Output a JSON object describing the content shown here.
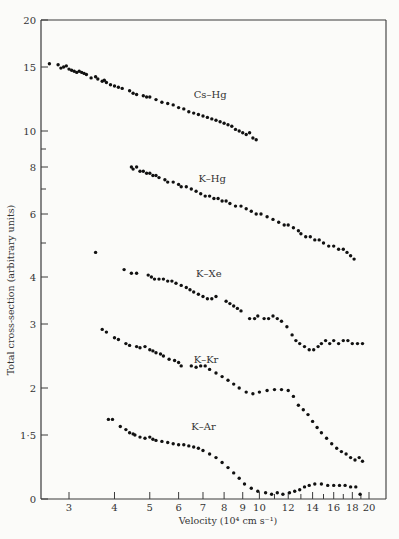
{
  "chart_data": {
    "type": "scatter",
    "title": "",
    "xlabel": "Velocity (10⁴ cm s⁻¹)",
    "ylabel": "Total cross-section (arbitrary units)",
    "xscale": "log",
    "yscale": "log (broken axis, 0 at bottom)",
    "xlim": [
      2.5,
      21
    ],
    "x_ticks": [
      3,
      4,
      5,
      6,
      7,
      8,
      9,
      10,
      12,
      14,
      16,
      18,
      20
    ],
    "y_ticks": [
      "0",
      "1·5",
      "2",
      "3",
      "4",
      "6",
      "8",
      "10",
      "15",
      "20"
    ],
    "y_minor_ticks": [
      5,
      7,
      9
    ],
    "grid": false,
    "legend": "inline labels next to each series",
    "series": [
      {
        "name": "Cs–Hg",
        "label_at": [
          6.6,
          12.3
        ],
        "points": [
          [
            2.65,
            15.3
          ],
          [
            2.8,
            15.2
          ],
          [
            2.85,
            14.9
          ],
          [
            2.9,
            15.0
          ],
          [
            2.95,
            15.1
          ],
          [
            3.0,
            14.8
          ],
          [
            3.05,
            14.7
          ],
          [
            3.1,
            14.6
          ],
          [
            3.15,
            14.5
          ],
          [
            3.2,
            14.6
          ],
          [
            3.25,
            14.5
          ],
          [
            3.3,
            14.4
          ],
          [
            3.35,
            14.3
          ],
          [
            3.45,
            14.0
          ],
          [
            3.55,
            14.1
          ],
          [
            3.6,
            13.9
          ],
          [
            3.7,
            13.7
          ],
          [
            3.75,
            13.8
          ],
          [
            3.8,
            13.6
          ],
          [
            3.9,
            13.4
          ],
          [
            4.0,
            13.3
          ],
          [
            4.1,
            13.2
          ],
          [
            4.2,
            13.1
          ],
          [
            4.4,
            12.9
          ],
          [
            4.5,
            12.7
          ],
          [
            4.6,
            12.6
          ],
          [
            4.8,
            12.5
          ],
          [
            4.9,
            12.4
          ],
          [
            5.0,
            12.4
          ],
          [
            5.2,
            12.2
          ],
          [
            5.4,
            12.0
          ],
          [
            5.6,
            11.9
          ],
          [
            5.8,
            11.8
          ],
          [
            6.0,
            11.6
          ],
          [
            6.2,
            11.5
          ],
          [
            6.4,
            11.3
          ],
          [
            6.6,
            11.2
          ],
          [
            6.8,
            11.1
          ],
          [
            7.0,
            11.0
          ],
          [
            7.2,
            10.9
          ],
          [
            7.4,
            10.8
          ],
          [
            7.6,
            10.7
          ],
          [
            7.8,
            10.6
          ],
          [
            8.0,
            10.5
          ],
          [
            8.2,
            10.4
          ],
          [
            8.4,
            10.3
          ],
          [
            8.6,
            10.1
          ],
          [
            8.8,
            10.0
          ],
          [
            9.0,
            9.9
          ],
          [
            9.2,
            9.8
          ],
          [
            9.4,
            9.9
          ],
          [
            9.6,
            9.6
          ],
          [
            9.8,
            9.5
          ]
        ]
      },
      {
        "name": "K–Hg",
        "label_at": [
          6.8,
          7.3
        ],
        "points": [
          [
            4.45,
            8.0
          ],
          [
            4.5,
            7.9
          ],
          [
            4.6,
            8.0
          ],
          [
            4.7,
            7.8
          ],
          [
            4.8,
            7.8
          ],
          [
            4.9,
            7.7
          ],
          [
            5.0,
            7.7
          ],
          [
            5.1,
            7.6
          ],
          [
            5.2,
            7.6
          ],
          [
            5.3,
            7.5
          ],
          [
            5.5,
            7.4
          ],
          [
            5.6,
            7.3
          ],
          [
            5.8,
            7.3
          ],
          [
            6.0,
            7.2
          ],
          [
            6.1,
            7.1
          ],
          [
            6.3,
            7.1
          ],
          [
            6.5,
            7.0
          ],
          [
            6.7,
            6.9
          ],
          [
            6.9,
            6.8
          ],
          [
            7.1,
            6.7
          ],
          [
            7.3,
            6.7
          ],
          [
            7.5,
            6.6
          ],
          [
            7.7,
            6.6
          ],
          [
            7.9,
            6.5
          ],
          [
            8.1,
            6.5
          ],
          [
            8.3,
            6.4
          ],
          [
            8.6,
            6.3
          ],
          [
            8.9,
            6.3
          ],
          [
            9.2,
            6.2
          ],
          [
            9.5,
            6.1
          ],
          [
            9.8,
            6.0
          ],
          [
            10.1,
            6.0
          ],
          [
            10.5,
            5.9
          ],
          [
            10.9,
            5.8
          ],
          [
            11.3,
            5.7
          ],
          [
            11.7,
            5.6
          ],
          [
            12.0,
            5.6
          ],
          [
            12.4,
            5.5
          ],
          [
            12.8,
            5.4
          ],
          [
            13.0,
            5.3
          ],
          [
            13.4,
            5.2
          ],
          [
            13.8,
            5.2
          ],
          [
            14.2,
            5.1
          ],
          [
            14.6,
            5.1
          ],
          [
            15.0,
            5.0
          ],
          [
            15.5,
            4.9
          ],
          [
            16.0,
            4.9
          ],
          [
            16.5,
            4.8
          ],
          [
            17.0,
            4.8
          ],
          [
            17.4,
            4.7
          ],
          [
            17.8,
            4.6
          ],
          [
            18.2,
            4.5
          ]
        ]
      },
      {
        "name": "K–Xe",
        "label_at": [
          6.7,
          4.0
        ],
        "points": [
          [
            3.55,
            4.7
          ],
          [
            4.25,
            4.2
          ],
          [
            4.45,
            4.1
          ],
          [
            4.6,
            4.1
          ],
          [
            4.95,
            4.05
          ],
          [
            5.05,
            4.0
          ],
          [
            5.15,
            3.95
          ],
          [
            5.3,
            3.95
          ],
          [
            5.45,
            3.95
          ],
          [
            5.6,
            3.9
          ],
          [
            5.75,
            3.9
          ],
          [
            5.9,
            3.85
          ],
          [
            6.1,
            3.8
          ],
          [
            6.3,
            3.75
          ],
          [
            6.45,
            3.7
          ],
          [
            6.6,
            3.65
          ],
          [
            6.8,
            3.6
          ],
          [
            7.0,
            3.55
          ],
          [
            7.2,
            3.5
          ],
          [
            7.4,
            3.5
          ],
          [
            7.6,
            3.55
          ],
          [
            8.1,
            3.45
          ],
          [
            8.3,
            3.4
          ],
          [
            8.5,
            3.35
          ],
          [
            8.7,
            3.3
          ],
          [
            8.9,
            3.25
          ],
          [
            9.4,
            3.1
          ],
          [
            9.7,
            3.1
          ],
          [
            9.9,
            3.15
          ],
          [
            10.3,
            3.1
          ],
          [
            10.6,
            3.1
          ],
          [
            10.9,
            3.15
          ],
          [
            11.2,
            3.1
          ],
          [
            11.5,
            3.05
          ],
          [
            11.9,
            2.95
          ],
          [
            12.3,
            2.8
          ],
          [
            12.6,
            2.7
          ],
          [
            12.9,
            2.65
          ],
          [
            13.3,
            2.6
          ],
          [
            13.7,
            2.55
          ],
          [
            14.1,
            2.55
          ],
          [
            14.5,
            2.6
          ],
          [
            14.8,
            2.65
          ],
          [
            15.2,
            2.7
          ],
          [
            15.6,
            2.65
          ],
          [
            16.0,
            2.7
          ],
          [
            16.5,
            2.65
          ],
          [
            17.0,
            2.7
          ],
          [
            17.5,
            2.7
          ],
          [
            18.0,
            2.65
          ],
          [
            18.6,
            2.65
          ],
          [
            19.2,
            2.65
          ]
        ]
      },
      {
        "name": "K–Kr",
        "label_at": [
          6.6,
          2.35
        ],
        "points": [
          [
            3.7,
            2.9
          ],
          [
            3.8,
            2.85
          ],
          [
            4.0,
            2.75
          ],
          [
            4.1,
            2.72
          ],
          [
            4.3,
            2.65
          ],
          [
            4.4,
            2.62
          ],
          [
            4.6,
            2.6
          ],
          [
            4.7,
            2.58
          ],
          [
            4.85,
            2.6
          ],
          [
            5.0,
            2.55
          ],
          [
            5.1,
            2.53
          ],
          [
            5.2,
            2.5
          ],
          [
            5.35,
            2.48
          ],
          [
            5.45,
            2.45
          ],
          [
            5.65,
            2.4
          ],
          [
            5.85,
            2.38
          ],
          [
            6.0,
            2.35
          ],
          [
            6.1,
            2.3
          ],
          [
            6.5,
            2.3
          ],
          [
            6.7,
            2.28
          ],
          [
            6.9,
            2.3
          ],
          [
            7.1,
            2.3
          ],
          [
            7.3,
            2.25
          ],
          [
            7.6,
            2.2
          ],
          [
            7.9,
            2.15
          ],
          [
            8.2,
            2.1
          ],
          [
            8.5,
            2.05
          ],
          [
            8.8,
            2.0
          ],
          [
            9.2,
            1.95
          ],
          [
            9.6,
            1.93
          ],
          [
            10.0,
            1.95
          ],
          [
            10.5,
            1.97
          ],
          [
            11.0,
            1.98
          ],
          [
            11.5,
            1.98
          ],
          [
            12.0,
            1.97
          ],
          [
            12.4,
            1.9
          ],
          [
            12.8,
            1.8
          ],
          [
            13.2,
            1.75
          ],
          [
            13.6,
            1.7
          ],
          [
            14.0,
            1.63
          ],
          [
            14.4,
            1.57
          ],
          [
            14.8,
            1.52
          ],
          [
            15.3,
            1.47
          ],
          [
            15.8,
            1.42
          ],
          [
            16.3,
            1.38
          ],
          [
            16.8,
            1.35
          ],
          [
            17.3,
            1.33
          ],
          [
            17.8,
            1.3
          ],
          [
            18.3,
            1.28
          ],
          [
            18.8,
            1.3
          ],
          [
            19.2,
            1.27
          ]
        ]
      },
      {
        "name": "K–Ar",
        "label_at": [
          6.5,
          1.55
        ],
        "points": [
          [
            3.85,
            1.65
          ],
          [
            3.95,
            1.65
          ],
          [
            4.15,
            1.58
          ],
          [
            4.3,
            1.55
          ],
          [
            4.4,
            1.52
          ],
          [
            4.5,
            1.51
          ],
          [
            4.55,
            1.5
          ],
          [
            4.7,
            1.48
          ],
          [
            4.85,
            1.47
          ],
          [
            5.0,
            1.48
          ],
          [
            5.1,
            1.46
          ],
          [
            5.2,
            1.45
          ],
          [
            5.4,
            1.44
          ],
          [
            5.6,
            1.43
          ],
          [
            5.8,
            1.42
          ],
          [
            6.0,
            1.41
          ],
          [
            6.2,
            1.41
          ],
          [
            6.4,
            1.4
          ],
          [
            6.6,
            1.39
          ],
          [
            6.8,
            1.38
          ],
          [
            7.0,
            1.36
          ],
          [
            7.3,
            1.33
          ],
          [
            7.6,
            1.3
          ],
          [
            7.9,
            1.26
          ],
          [
            8.2,
            1.22
          ],
          [
            8.5,
            1.18
          ],
          [
            8.8,
            1.14
          ],
          [
            9.1,
            1.1
          ],
          [
            9.5,
            1.07
          ],
          [
            9.9,
            1.05
          ],
          [
            10.4,
            1.04
          ],
          [
            10.8,
            1.03
          ],
          [
            11.2,
            1.04
          ],
          [
            11.6,
            1.03
          ],
          [
            12.1,
            1.04
          ],
          [
            12.5,
            1.05
          ],
          [
            12.9,
            1.06
          ],
          [
            13.3,
            1.08
          ],
          [
            13.7,
            1.09
          ],
          [
            14.2,
            1.1
          ],
          [
            14.8,
            1.1
          ],
          [
            15.4,
            1.09
          ],
          [
            16.0,
            1.09
          ],
          [
            16.6,
            1.09
          ],
          [
            17.2,
            1.09
          ],
          [
            17.8,
            1.08
          ],
          [
            18.4,
            1.08
          ],
          [
            18.9,
            1.03
          ]
        ]
      }
    ]
  }
}
